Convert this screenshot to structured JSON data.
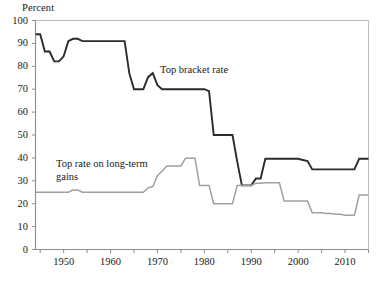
{
  "figure": {
    "y_axis_unit_label": "Percent",
    "background_color": "#ffffff"
  },
  "annotations": {
    "top_bracket": "Top bracket rate",
    "long_term_gains": "Top rate on long-term\ngains"
  },
  "chart_data": {
    "type": "line",
    "title": "",
    "subtitle": "",
    "xlabel": "",
    "ylabel": "Percent",
    "xlim": [
      1944,
      2015
    ],
    "ylim": [
      0,
      100
    ],
    "grid": false,
    "legend_position": "inline-annotation",
    "y_ticks": [
      0,
      10,
      20,
      30,
      40,
      50,
      60,
      70,
      80,
      90,
      100
    ],
    "y_tick_labels": [
      "0",
      "10",
      "20",
      "30",
      "40",
      "50",
      "60",
      "70",
      "80",
      "90",
      "100"
    ],
    "x_ticks": [
      1945,
      1950,
      1955,
      1960,
      1965,
      1970,
      1975,
      1980,
      1985,
      1990,
      1995,
      2000,
      2005,
      2010,
      2015
    ],
    "x_tick_labels_shown": [
      "1950",
      "1960",
      "1970",
      "1980",
      "1990",
      "2000",
      "2010"
    ],
    "x_tick_labels_shown_values": [
      1950,
      1960,
      1970,
      1980,
      1990,
      2000,
      2010
    ],
    "series": [
      {
        "name": "Top bracket rate",
        "color": "#2b2b2b",
        "width": 1.9,
        "x": [
          1944,
          1945,
          1946,
          1947,
          1948,
          1949,
          1950,
          1951,
          1952,
          1953,
          1954,
          1955,
          1956,
          1957,
          1958,
          1959,
          1960,
          1961,
          1962,
          1963,
          1964,
          1965,
          1966,
          1967,
          1968,
          1969,
          1970,
          1971,
          1972,
          1973,
          1974,
          1975,
          1976,
          1977,
          1978,
          1979,
          1980,
          1981,
          1982,
          1983,
          1984,
          1985,
          1986,
          1987,
          1988,
          1989,
          1990,
          1991,
          1992,
          1993,
          1994,
          1995,
          1996,
          1997,
          1998,
          1999,
          2000,
          2001,
          2002,
          2003,
          2004,
          2005,
          2006,
          2007,
          2008,
          2009,
          2010,
          2011,
          2012,
          2013,
          2014,
          2015
        ],
        "values": [
          94,
          94,
          86.45,
          86.45,
          82.13,
          82.13,
          84.36,
          91,
          92,
          92,
          91,
          91,
          91,
          91,
          91,
          91,
          91,
          91,
          91,
          91,
          77,
          70,
          70,
          70,
          75.25,
          77,
          71.75,
          70,
          70,
          70,
          70,
          70,
          70,
          70,
          70,
          70,
          70,
          69.13,
          50,
          50,
          50,
          50,
          50,
          38.5,
          28,
          28,
          28,
          31,
          31,
          39.6,
          39.6,
          39.6,
          39.6,
          39.6,
          39.6,
          39.6,
          39.6,
          39.1,
          38.6,
          35,
          35,
          35,
          35,
          35,
          35,
          35,
          35,
          35,
          35,
          39.6,
          39.6,
          39.6
        ]
      },
      {
        "name": "Top rate on long-term gains",
        "color": "#a0a0a0",
        "width": 1.5,
        "x": [
          1944,
          1945,
          1946,
          1947,
          1948,
          1949,
          1950,
          1951,
          1952,
          1953,
          1954,
          1955,
          1956,
          1957,
          1958,
          1959,
          1960,
          1961,
          1962,
          1963,
          1964,
          1965,
          1966,
          1967,
          1968,
          1969,
          1970,
          1971,
          1972,
          1973,
          1974,
          1975,
          1976,
          1977,
          1978,
          1979,
          1980,
          1981,
          1982,
          1983,
          1984,
          1985,
          1986,
          1987,
          1988,
          1989,
          1990,
          1991,
          1992,
          1993,
          1994,
          1995,
          1996,
          1997,
          1998,
          1999,
          2000,
          2001,
          2002,
          2003,
          2004,
          2005,
          2006,
          2007,
          2008,
          2009,
          2010,
          2011,
          2012,
          2013,
          2014,
          2015
        ],
        "values": [
          25,
          25,
          25,
          25,
          25,
          25,
          25,
          25,
          26,
          26,
          25,
          25,
          25,
          25,
          25,
          25,
          25,
          25,
          25,
          25,
          25,
          25,
          25,
          25,
          26.9,
          27.5,
          32.21,
          34.25,
          36.5,
          36.5,
          36.5,
          36.5,
          39.875,
          39.875,
          39.875,
          28,
          28,
          28,
          20,
          20,
          20,
          20,
          20,
          28,
          28,
          28,
          28,
          28.93,
          28.93,
          29.19,
          29.19,
          29.19,
          29.19,
          21.19,
          21.19,
          21.19,
          21.19,
          21.17,
          21.16,
          16.05,
          16.05,
          16.05,
          15.7,
          15.7,
          15.35,
          15.35,
          15,
          15,
          15,
          23.8,
          23.8,
          23.8
        ]
      }
    ]
  }
}
